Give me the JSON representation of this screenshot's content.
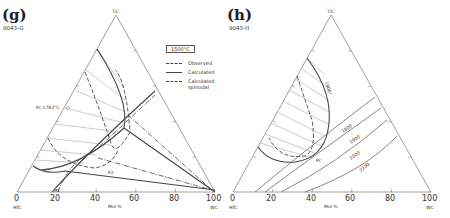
{
  "panels": [
    {
      "label": "(g)",
      "id": "9043-G",
      "vertices": {
        "top": "TiC",
        "left": "HfC",
        "right": "WC"
      },
      "axis_label": "Mol %",
      "ticks": [
        "0",
        "20",
        "40",
        "60",
        "80",
        "100"
      ],
      "annotations": {
        "pc_label": "Pc,1783°C",
        "p1": "P1",
        "p2": "P2"
      },
      "legend": {
        "temperature": "1500°C",
        "items": [
          "Observed",
          "Calculated",
          "Calculated spinodal"
        ]
      }
    },
    {
      "label": "(h)",
      "id": "9043-H",
      "vertices": {
        "top": "TiC",
        "left": "HfC",
        "right": "WC"
      },
      "axis_label": "Mol %",
      "ticks": [
        "0",
        "20",
        "40",
        "60",
        "80",
        "100"
      ],
      "annotations": {
        "pc": "Pc",
        "isotherm": "1800°"
      },
      "contours": [
        "1800",
        "1900",
        "2000",
        "2200"
      ]
    }
  ],
  "colors": {
    "line": "#444444",
    "tie": "#aaaaaa",
    "frame": "#777777"
  }
}
